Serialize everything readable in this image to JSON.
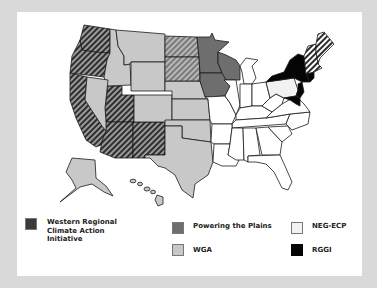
{
  "map": {
    "title": "US Regional Climate Initiatives",
    "colors": {
      "western_regional": "#3a3a3a",
      "powering_the_plains": "#6e6e6e",
      "wga": "#c8c8c8",
      "neg_ecp": "#f2f2f2",
      "rggi": "#050505",
      "none": "#ffffff",
      "background": "#d9d9d9"
    },
    "regions": {
      "western_regional": [
        "Washington",
        "Oregon",
        "California",
        "Arizona",
        "New Mexico",
        "Utah"
      ],
      "powering_the_plains_solid": [
        "Minnesota",
        "Wisconsin",
        "Iowa"
      ],
      "powering_the_plains_hatched": [
        "North Dakota",
        "South Dakota"
      ],
      "wga": [
        "Idaho",
        "Montana",
        "Wyoming",
        "Nevada",
        "Colorado",
        "Nebraska",
        "Kansas",
        "Oklahoma",
        "Texas",
        "Alaska",
        "Hawaii"
      ],
      "rggi": [
        "New York",
        "New Jersey",
        "Delaware",
        "Maryland",
        "Connecticut"
      ],
      "rggi_hatched": [
        "Maine",
        "New Hampshire",
        "Vermont",
        "Massachusetts"
      ]
    }
  },
  "legend": {
    "items": [
      {
        "label_lines": [
          "Western Regional",
          "Climate Action",
          "Initiative"
        ],
        "color": "#3a3a3a"
      },
      {
        "label_lines": [
          "Powering the Plains"
        ],
        "color": "#6e6e6e"
      },
      {
        "label_lines": [
          "NEG-ECP"
        ],
        "color": "#f2f2f2"
      },
      {
        "label_lines": [
          "WGA"
        ],
        "color": "#c8c8c8"
      },
      {
        "label_lines": [
          "RGGI"
        ],
        "color": "#050505"
      }
    ]
  }
}
